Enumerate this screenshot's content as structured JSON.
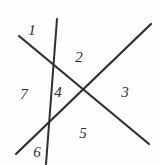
{
  "figure": {
    "background_color": "#fdfdfd",
    "line_color": "#2f2f2f",
    "label_color": "#2b2b2b",
    "width": 161,
    "height": 165
  },
  "lines": [
    {
      "name": "near-vertical-line",
      "x1": 57,
      "y1": 19,
      "x2": 46,
      "y2": 164,
      "stroke_width": 2.0
    },
    {
      "name": "descending-diagonal-line",
      "x1": 19,
      "y1": 36,
      "x2": 149,
      "y2": 144,
      "stroke_width": 2.2
    },
    {
      "name": "ascending-diagonal-line",
      "x1": 16,
      "y1": 154,
      "x2": 151,
      "y2": 24,
      "stroke_width": 2.2
    }
  ],
  "labels": [
    {
      "id": "label-1",
      "text": "1",
      "x": 32,
      "y": 30
    },
    {
      "id": "label-2",
      "text": "2",
      "x": 79,
      "y": 57
    },
    {
      "id": "label-3",
      "text": "3",
      "x": 125,
      "y": 92
    },
    {
      "id": "label-4",
      "text": "4",
      "x": 58,
      "y": 92
    },
    {
      "id": "label-5",
      "text": "5",
      "x": 83,
      "y": 133
    },
    {
      "id": "label-6",
      "text": "6",
      "x": 37,
      "y": 152
    },
    {
      "id": "label-7",
      "text": "7",
      "x": 24,
      "y": 94
    }
  ]
}
